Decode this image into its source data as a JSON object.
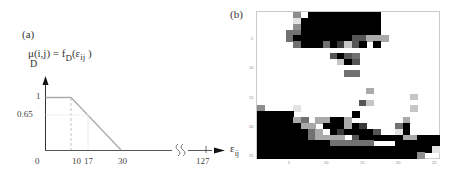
{
  "panel_a": {
    "label": "(a)",
    "formula": {
      "lhs_main": "μ(i,j) = f",
      "lhs_sub": "D",
      "rhs_main": "(ε",
      "rhs_sub": "ij",
      "close": " )",
      "mu_sub": "D"
    },
    "y_ticks": [
      "1",
      "0.65"
    ],
    "x_ticks": [
      "0",
      "10",
      "17",
      "30",
      "127"
    ],
    "x_axis_label_main": "ε",
    "x_axis_label_sub": "ij",
    "break_symbol": "≈"
  },
  "panel_b": {
    "label": "(b)",
    "x_ticks": [
      "5",
      "10",
      "15",
      "20",
      "25"
    ],
    "y_ticks": [
      "5",
      "10",
      "15",
      "20",
      "25"
    ]
  },
  "chart_data": [
    {
      "type": "line",
      "title": "(a) Membership function μ_D(i,j) = f_D(ε_ij)",
      "xlabel": "ε_ij",
      "ylabel": "μ_D(i,j)",
      "x": [
        0,
        10,
        30,
        127
      ],
      "y": [
        1,
        1,
        0,
        0
      ],
      "annotations": [
        "dashed guide at x=10",
        "dotted guide at x=17 (y=0.65)"
      ],
      "x_ticks": [
        0,
        10,
        17,
        30,
        127
      ],
      "y_ticks": [
        0.65,
        1
      ],
      "axis_break": "between 30 and 127",
      "grid": false
    },
    {
      "type": "heatmap",
      "title": "(b)",
      "xlabel": "",
      "ylabel": "ε_ij",
      "x_ticks": [
        5,
        10,
        15,
        20,
        25
      ],
      "y_ticks": [
        5,
        10,
        15,
        20,
        25
      ],
      "colormap": "gray (0=black, 9=white)",
      "rows": 25,
      "cols": 25,
      "values": [
        "9999959000000000099999999",
        "9999980000000000099999999",
        "9999950000000000099999999",
        "9999440000000000099999999",
        "9999400000000336669999999",
        "9999940004027309099999999",
        "9999999999999999999999999",
        "9999999999303499999999999",
        "9999999999970399999999999",
        "9999999999999999999999999",
        "9999999999994499999999999",
        "9999999999999999999999999",
        "9999999999999999999999999",
        "9999999999999996999999999",
        "9999999999999999999997999",
        "9999999999999937999999999",
        "5999989999999999999997999",
        "0000099999999099999999999",
        "0000064966006999999969999",
        "0000006690006029999409999",
        "0000000469020000399809999",
        "0000000466669300000066000",
        "0000000000444444999000000",
        "0000000000000000000000008",
        "0000000000000000000000599"
      ]
    }
  ]
}
